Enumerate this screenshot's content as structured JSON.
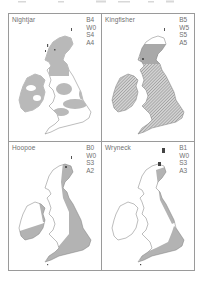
{
  "figure": {
    "panels": [
      {
        "species": "Nightjar",
        "codes": [
          "B4",
          "W0",
          "S4",
          "A4"
        ],
        "shading": "solid-grey-patchy",
        "shade_color": "#b9b9b9"
      },
      {
        "species": "Kingfisher",
        "codes": [
          "B5",
          "W5",
          "S5",
          "A5"
        ],
        "shading": "hatched-widespread",
        "shade_color": "#9c9c9c"
      },
      {
        "species": "Hoopoe",
        "codes": [
          "B0",
          "W0",
          "S3",
          "A2"
        ],
        "shading": "solid-grey-east-south",
        "shade_color": "#b3b3b3"
      },
      {
        "species": "Wryneck",
        "codes": [
          "B1",
          "W0",
          "S3",
          "A3"
        ],
        "shading": "solid-grey-east-coast-southeast",
        "shade_color": "#b3b3b3"
      }
    ]
  },
  "colors": {
    "border": "#9a9a9a",
    "outline": "#7a7a7a",
    "text": "#6f6f6f",
    "background": "#ffffff"
  }
}
